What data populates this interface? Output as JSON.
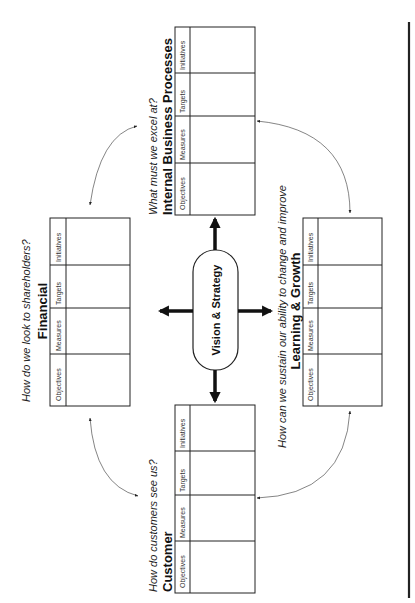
{
  "diagram": {
    "type": "balanced-scorecard",
    "orientation": "rotated-90-ccw",
    "center": {
      "label": "Vision & Strategy"
    },
    "columns": [
      "Objectives",
      "Measures",
      "Targets",
      "Initiatives"
    ],
    "perspectives": {
      "financial": {
        "title": "Financial",
        "question": "How do we look to shareholders?",
        "columns": [
          "Objectives",
          "Measures",
          "Targets",
          "Initiatives"
        ]
      },
      "customer": {
        "title": "Customer",
        "question": "How do customers see us?",
        "columns": [
          "Objectives",
          "Measures",
          "Targets",
          "Initiatives"
        ]
      },
      "internal": {
        "title": "Internal Business Processes",
        "question": "What must we excel at?",
        "columns": [
          "Objectives",
          "Measures",
          "Targets",
          "Initiatives"
        ]
      },
      "learning": {
        "title": "Learning & Growth",
        "question": "How can we sustain our ability to change and improve",
        "columns": [
          "Objectives",
          "Measures",
          "Targets",
          "Initiatives"
        ]
      }
    },
    "connectors": [
      {
        "from": "financial",
        "to": "internal",
        "style": "curved-double-arrow"
      },
      {
        "from": "internal",
        "to": "learning",
        "style": "curved-double-arrow"
      },
      {
        "from": "learning",
        "to": "customer",
        "style": "curved-double-arrow"
      },
      {
        "from": "customer",
        "to": "financial",
        "style": "curved-double-arrow"
      }
    ],
    "colors": {
      "line": "#222222",
      "text": "#111111",
      "background": "#ffffff"
    }
  }
}
